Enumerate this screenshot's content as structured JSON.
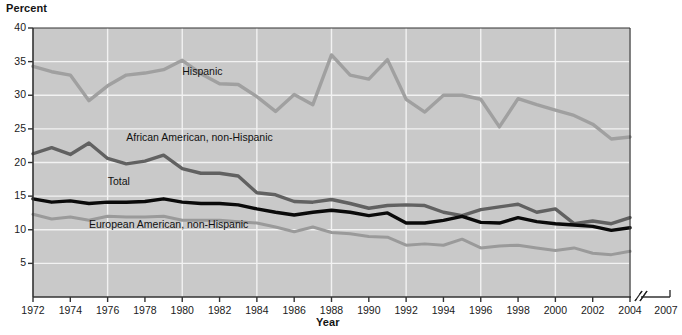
{
  "chart_data": {
    "type": "line",
    "title": "",
    "xlabel": "Year",
    "ylabel": "Percent",
    "ylim": [
      0,
      40
    ],
    "xlim": [
      1972,
      2004
    ],
    "grid": true,
    "legend_position": "inline-annotations",
    "axis_break_note": "Axis break between 2004 and 2007",
    "yticks": [
      40,
      35,
      30,
      25,
      20,
      15,
      10,
      5
    ],
    "xticks": [
      1972,
      1974,
      1976,
      1978,
      1980,
      1982,
      1984,
      1986,
      1988,
      1990,
      1992,
      1994,
      1996,
      1998,
      2000,
      2002,
      2004,
      2007
    ],
    "x": [
      1972,
      1973,
      1974,
      1975,
      1976,
      1977,
      1978,
      1979,
      1980,
      1981,
      1982,
      1983,
      1984,
      1985,
      1986,
      1987,
      1988,
      1989,
      1990,
      1991,
      1992,
      1993,
      1994,
      1995,
      1996,
      1997,
      1998,
      1999,
      2000,
      2001,
      2002,
      2003,
      2004
    ],
    "series": [
      {
        "name": "Hispanic",
        "color": "#a0a0a0",
        "width": 3.4,
        "label_x": 1980,
        "label_y": 33.4,
        "values": [
          34.3,
          33.5,
          33.0,
          29.2,
          31.4,
          33.0,
          33.3,
          33.8,
          35.2,
          33.2,
          31.7,
          31.6,
          29.8,
          27.6,
          30.1,
          28.6,
          36.0,
          33.0,
          32.4,
          35.3,
          29.4,
          27.5,
          30.0,
          30.0,
          29.4,
          25.3,
          29.5,
          28.6,
          27.8,
          27.0,
          25.7,
          23.5,
          23.8
        ]
      },
      {
        "name": "African American, non-Hispanic",
        "color": "#616161",
        "width": 3.4,
        "label_x": 1977,
        "label_y": 23.6,
        "values": [
          21.3,
          22.2,
          21.2,
          22.9,
          20.6,
          19.8,
          20.2,
          21.1,
          19.1,
          18.4,
          18.4,
          18.0,
          15.5,
          15.2,
          14.2,
          14.1,
          14.5,
          13.9,
          13.2,
          13.6,
          13.7,
          13.6,
          12.6,
          12.1,
          13.0,
          13.4,
          13.8,
          12.6,
          13.1,
          10.9,
          11.3,
          10.9,
          11.8
        ]
      },
      {
        "name": "Total",
        "color": "#0a0a0a",
        "width": 3.4,
        "label_x": 1976,
        "label_y": 17.1,
        "values": [
          14.6,
          14.1,
          14.3,
          13.9,
          14.1,
          14.1,
          14.2,
          14.6,
          14.1,
          13.9,
          13.9,
          13.7,
          13.1,
          12.6,
          12.2,
          12.6,
          12.9,
          12.6,
          12.1,
          12.5,
          11.0,
          11.0,
          11.4,
          12.0,
          11.1,
          11.0,
          11.8,
          11.2,
          10.9,
          10.7,
          10.5,
          9.9,
          10.3
        ]
      },
      {
        "name": "European American, non-Hispanic",
        "color": "#9a9a9a",
        "width": 3.0,
        "label_x": 1975,
        "label_y": 10.7,
        "values": [
          12.3,
          11.6,
          11.9,
          11.4,
          12.0,
          11.9,
          11.9,
          12.0,
          11.4,
          11.4,
          11.4,
          11.2,
          11.0,
          10.4,
          9.7,
          10.4,
          9.6,
          9.4,
          9.0,
          8.9,
          7.7,
          7.9,
          7.7,
          8.6,
          7.3,
          7.6,
          7.7,
          7.3,
          6.9,
          7.3,
          6.5,
          6.3,
          6.8
        ]
      }
    ],
    "plot_bg": "#c9c9c9",
    "grid_color": "#f2f2f2",
    "axis_color": "#333333"
  },
  "axes": {
    "y_title": "Percent",
    "x_title": "Year"
  }
}
